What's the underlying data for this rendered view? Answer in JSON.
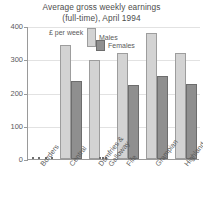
{
  "chart_data": {
    "type": "bar",
    "title": "Average gross weekly earnings (full-time), April 1994",
    "title_line_1": "Average gross weekly earnings",
    "title_line_2": "(full-time), April 1994",
    "unit_label": "£ per week",
    "xlabel": "",
    "ylabel": "",
    "ylim": [
      0,
      400
    ],
    "y_ticks": [
      0,
      100,
      200,
      300,
      400
    ],
    "y_tick_labels": [
      "0",
      "100",
      "200",
      "300",
      "400"
    ],
    "grid": true,
    "legend_position": "top-center",
    "categories": [
      "Borders",
      "Central",
      "Dumfries & Galloway",
      "Fife",
      "Grampian",
      "Highland"
    ],
    "category_lines": [
      [
        "Borders"
      ],
      [
        "Central"
      ],
      [
        "Dumfries &",
        "Galloway"
      ],
      [
        "Fife"
      ],
      [
        "Grampian"
      ],
      [
        "Highland"
      ]
    ],
    "series": [
      {
        "name": "Males",
        "color": "#d3d3d3",
        "values": [
          0,
          343,
          297,
          320,
          380,
          320
        ]
      },
      {
        "name": "Females",
        "color": "#8f8f8f",
        "values": [
          0,
          235,
          0,
          222,
          250,
          226
        ]
      }
    ]
  }
}
